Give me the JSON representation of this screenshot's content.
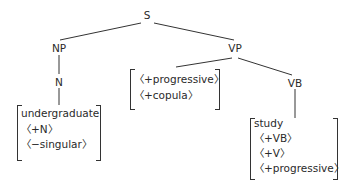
{
  "tree": {
    "root": "S",
    "np": "NP",
    "vp": "VP",
    "n": "N",
    "vb": "VB"
  },
  "features": {
    "n_bundle": [
      "undergraduate",
      "〈+N〉",
      "〈−singular〉"
    ],
    "vp_bundle": [
      "〈+progressive〉",
      "〈+copula〉"
    ],
    "vb_bundle": [
      "study",
      "〈+VB〉",
      "〈+V〉",
      "〈+progressive〉"
    ]
  }
}
